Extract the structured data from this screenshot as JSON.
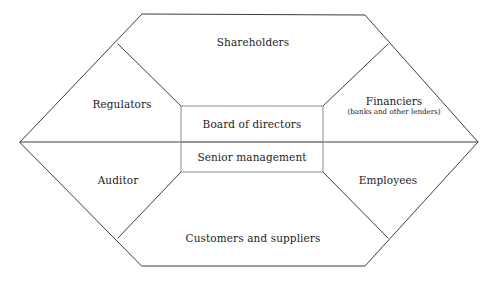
{
  "diagram": {
    "type": "hexagon-stakeholder-diagram",
    "stroke_color": "#3d3d3d",
    "background_color": "#ffffff",
    "core": {
      "top_label": "Board of directors",
      "bottom_label": "Senior management"
    },
    "outer_segments": [
      {
        "id": "shareholders",
        "label": "Shareholders",
        "sublabel": "",
        "position": "top"
      },
      {
        "id": "regulators",
        "label": "Regulators",
        "sublabel": "",
        "position": "upper-left"
      },
      {
        "id": "financiers",
        "label": "Financiers",
        "sublabel": "(banks and other lenders)",
        "position": "upper-right"
      },
      {
        "id": "auditor",
        "label": "Auditor",
        "sublabel": "",
        "position": "lower-left"
      },
      {
        "id": "employees",
        "label": "Employees",
        "sublabel": "",
        "position": "lower-right"
      },
      {
        "id": "customers-and-suppliers",
        "label": "Customers and suppliers",
        "sublabel": "",
        "position": "bottom"
      }
    ]
  }
}
